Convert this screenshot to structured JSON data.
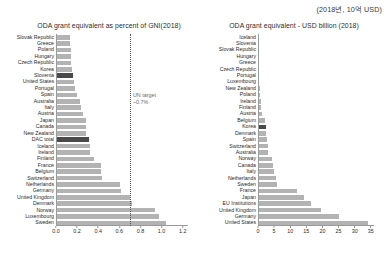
{
  "corner_note": "(2018년, 10억 USD)",
  "chart_data": [
    {
      "id": "gni_percent",
      "type": "bar",
      "orientation": "horizontal",
      "title": "ODA grant equivalent as percent of GNI(2018)",
      "xlabel": "",
      "ylabel": "",
      "xlim": [
        0,
        1.25
      ],
      "xticks": [
        "0.0",
        "0.2",
        "0.4",
        "0.6",
        "0.8",
        "1.0",
        "1.2"
      ],
      "xtick_values": [
        0.0,
        0.2,
        0.4,
        0.6,
        0.8,
        1.0,
        1.2
      ],
      "grid": false,
      "highlight_color": "#4a4a4a",
      "bar_color": "#b3b3b3",
      "annotation": {
        "label_line1": "UN target",
        "label_line2": "~0.7%",
        "value": 0.7
      },
      "categories": [
        "Slovak Republic",
        "Greece",
        "Poland",
        "Hungary",
        "Czech Republic",
        "Korea",
        "Slovenia",
        "United States",
        "Portugal",
        "Spain",
        "Australia",
        "Italy",
        "Austria",
        "Japan",
        "Canada",
        "New Zealand",
        "DAC total",
        "Iceland",
        "Ireland",
        "Finland",
        "France",
        "Belgium",
        "Switzerland",
        "Netherlands",
        "Germany",
        "United Kingdom",
        "Denmark",
        "Norway",
        "Luxembourg",
        "Sweden"
      ],
      "values": [
        0.13,
        0.13,
        0.14,
        0.14,
        0.14,
        0.15,
        0.16,
        0.17,
        0.18,
        0.2,
        0.23,
        0.24,
        0.26,
        0.28,
        0.28,
        0.28,
        0.31,
        0.32,
        0.32,
        0.36,
        0.43,
        0.43,
        0.44,
        0.61,
        0.62,
        0.7,
        0.72,
        0.94,
        0.98,
        1.04
      ],
      "highlighted": [
        "Slovenia",
        "DAC total"
      ]
    },
    {
      "id": "usd_billion",
      "type": "bar",
      "orientation": "horizontal",
      "title": "ODA grant equivalent - USD billion (2018)",
      "xlabel": "",
      "ylabel": "",
      "xlim": [
        0,
        36
      ],
      "xticks": [
        "0",
        "5",
        "10",
        "15",
        "20",
        "25",
        "30",
        "35"
      ],
      "xtick_values": [
        0,
        5,
        10,
        15,
        20,
        25,
        30,
        35
      ],
      "grid": false,
      "highlight_color": "#4a4a4a",
      "bar_color": "#b3b3b3",
      "categories": [
        "Iceland",
        "Slovenia",
        "Slovak Republic",
        "Hungary",
        "Greece",
        "Czech Republic",
        "Portugal",
        "Luxembourg",
        "New Zealand",
        "Poland",
        "Ireland",
        "Finland",
        "Austria",
        "Belgium",
        "Korea",
        "Denmark",
        "Spain",
        "Switzerland",
        "Australia",
        "Norway",
        "Canada",
        "Italy",
        "Netherlands",
        "Sweden",
        "France",
        "Japan",
        "EU Institutions",
        "United Kingdom",
        "Germany",
        "United States"
      ],
      "values": [
        0.07,
        0.08,
        0.13,
        0.28,
        0.29,
        0.3,
        0.38,
        0.46,
        0.55,
        0.76,
        0.93,
        0.98,
        1.17,
        2.31,
        2.36,
        2.58,
        2.64,
        3.12,
        3.15,
        4.26,
        4.66,
        5.09,
        5.66,
        5.84,
        12.21,
        14.16,
        16.45,
        19.42,
        25.0,
        34.2
      ],
      "highlighted": [
        "Korea"
      ]
    }
  ]
}
